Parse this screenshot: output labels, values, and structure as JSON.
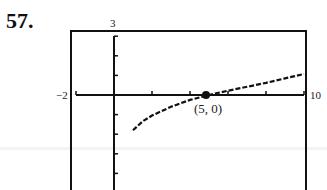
{
  "problem_number": "57.",
  "chart_data": {
    "type": "line",
    "title": "",
    "xlabel": "",
    "ylabel": "",
    "xlim": [
      -2,
      10
    ],
    "ylim": [
      -5,
      3
    ],
    "x_window_labels": {
      "xmin": "−2",
      "xmax": "10",
      "ymax": "3"
    },
    "x_tick_spacing": 2,
    "y_tick_spacing": 1,
    "grid": false,
    "series": [
      {
        "name": "curve",
        "style": "dotted/dashed calculator plot",
        "x": [
          1.0,
          1.5,
          2,
          3,
          4,
          5,
          6,
          7,
          8,
          9,
          10
        ],
        "y": [
          -1.8,
          -1.35,
          -1.05,
          -0.6,
          -0.25,
          0.0,
          0.22,
          0.42,
          0.62,
          0.85,
          1.07
        ]
      }
    ],
    "annotations": [
      {
        "point": [
          5,
          0
        ],
        "label": "(5, 0)",
        "marker": "filled-dot"
      }
    ]
  }
}
